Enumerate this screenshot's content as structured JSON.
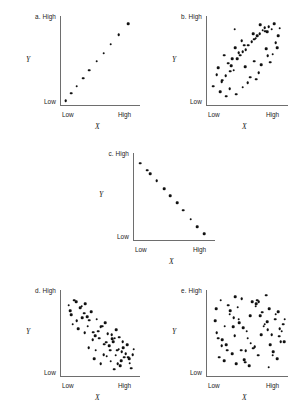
{
  "figure": {
    "background": "#ffffff",
    "dot_color": "#111111",
    "axis_color": "#6e6e6e",
    "axis_labels": {
      "x_var": "X",
      "y_var": "Y",
      "low": "Low",
      "high": "High"
    }
  },
  "chart_data": [
    {
      "type": "scatter",
      "id": "a",
      "panel_label": "a. High",
      "letter": "a",
      "title": "",
      "xlabel": "X",
      "ylabel": "Y",
      "xlim": [
        0,
        100
      ],
      "ylim": [
        0,
        100
      ],
      "xtick_labels": [
        "Low",
        "High"
      ],
      "ytick_labels": [
        "Low",
        "High"
      ],
      "grid": false,
      "relationship": "perfect positive linear correlation",
      "n_points": 10,
      "x": [
        6,
        13,
        20,
        28,
        36,
        45,
        54,
        63,
        73,
        85
      ],
      "y": [
        5,
        13,
        21,
        30,
        39,
        49,
        58,
        68,
        79,
        91
      ]
    },
    {
      "type": "scatter",
      "id": "b",
      "panel_label": "b. High",
      "letter": "b",
      "title": "",
      "xlabel": "X",
      "ylabel": "Y",
      "xlim": [
        0,
        100
      ],
      "ylim": [
        0,
        100
      ],
      "xtick_labels": [
        "Low",
        "High"
      ],
      "ytick_labels": [
        "Low",
        "High"
      ],
      "grid": false,
      "relationship": "moderate positive correlation",
      "n_points": 56,
      "x": [
        12,
        19,
        8,
        26,
        33,
        16,
        41,
        23,
        48,
        30,
        55,
        37,
        62,
        44,
        69,
        51,
        76,
        58,
        83,
        65,
        90,
        72,
        21,
        35,
        28,
        43,
        50,
        57,
        64,
        71,
        78,
        85,
        14,
        31,
        24,
        39,
        46,
        53,
        60,
        67,
        74,
        81,
        88,
        18,
        36,
        29,
        44,
        58,
        66,
        73,
        80,
        87,
        34,
        47,
        61,
        75
      ],
      "y": [
        34,
        28,
        21,
        47,
        39,
        15,
        56,
        33,
        62,
        44,
        71,
        52,
        78,
        60,
        84,
        67,
        88,
        74,
        91,
        80,
        86,
        83,
        56,
        64,
        18,
        72,
        25,
        80,
        36,
        87,
        48,
        70,
        42,
        52,
        10,
        59,
        67,
        31,
        75,
        45,
        82,
        57,
        78,
        26,
        12,
        38,
        20,
        49,
        90,
        63,
        85,
        64,
        85,
        43,
        29,
        55
      ]
    },
    {
      "type": "scatter",
      "id": "c",
      "panel_label": "c. High",
      "letter": "c",
      "title": "",
      "xlabel": "X",
      "ylabel": "Y",
      "xlim": [
        0,
        100
      ],
      "ylim": [
        0,
        100
      ],
      "xtick_labels": [
        "Low",
        "High"
      ],
      "ytick_labels": [
        "Low",
        "High"
      ],
      "grid": false,
      "relationship": "perfect negative linear correlation",
      "n_points": 11,
      "x": [
        8,
        16,
        20,
        28,
        37,
        45,
        53,
        61,
        70,
        78,
        87
      ],
      "y": [
        88,
        80,
        76,
        68,
        59,
        51,
        43,
        34,
        24,
        15,
        7
      ]
    },
    {
      "type": "scatter",
      "id": "d",
      "panel_label": "d. High",
      "letter": "d",
      "title": "",
      "xlabel": "X",
      "ylabel": "Y",
      "xlim": [
        0,
        100
      ],
      "ylim": [
        0,
        100
      ],
      "xtick_labels": [
        "Low",
        "High"
      ],
      "ytick_labels": [
        "Low",
        "High"
      ],
      "grid": false,
      "relationship": "moderate negative correlation",
      "n_points": 64,
      "x": [
        10,
        17,
        24,
        13,
        31,
        20,
        38,
        27,
        45,
        34,
        52,
        41,
        59,
        48,
        66,
        55,
        73,
        62,
        80,
        69,
        87,
        76,
        15,
        29,
        22,
        36,
        43,
        50,
        57,
        64,
        71,
        78,
        85,
        92,
        12,
        26,
        33,
        40,
        47,
        54,
        61,
        68,
        75,
        82,
        89,
        19,
        35,
        42,
        56,
        63,
        70,
        77,
        84,
        91,
        30,
        44,
        58,
        65,
        72,
        79,
        86,
        50,
        67,
        74
      ],
      "y": [
        82,
        88,
        79,
        71,
        84,
        64,
        75,
        68,
        66,
        58,
        58,
        51,
        49,
        44,
        40,
        37,
        31,
        30,
        22,
        24,
        15,
        18,
        60,
        73,
        55,
        65,
        47,
        57,
        39,
        48,
        30,
        40,
        22,
        31,
        76,
        81,
        69,
        42,
        52,
        25,
        35,
        44,
        12,
        26,
        9,
        86,
        33,
        20,
        62,
        17,
        54,
        28,
        36,
        25,
        50,
        30,
        23,
        43,
        14,
        33,
        20,
        14,
        8,
        45
      ]
    },
    {
      "type": "scatter",
      "id": "e",
      "panel_label": "e. High",
      "letter": "e",
      "title": "",
      "xlabel": "X",
      "ylabel": "Y",
      "xlim": [
        0,
        100
      ],
      "ylim": [
        0,
        100
      ],
      "xtick_labels": [
        "Low",
        "High"
      ],
      "ytick_labels": [
        "Low",
        "High"
      ],
      "grid": false,
      "relationship": "no correlation",
      "n_points": 68,
      "x": [
        14,
        28,
        42,
        56,
        70,
        84,
        21,
        35,
        49,
        63,
        77,
        91,
        10,
        24,
        38,
        52,
        66,
        80,
        94,
        17,
        31,
        45,
        59,
        73,
        87,
        12,
        26,
        40,
        54,
        68,
        82,
        96,
        19,
        33,
        47,
        61,
        75,
        89,
        15,
        29,
        43,
        57,
        71,
        85,
        22,
        36,
        50,
        64,
        78,
        92,
        11,
        25,
        39,
        53,
        67,
        81,
        95,
        18,
        32,
        46,
        60,
        74,
        88,
        34,
        62,
        76,
        90,
        48
      ],
      "y": [
        44,
        72,
        30,
        86,
        58,
        66,
        18,
        92,
        52,
        24,
        78,
        40,
        64,
        36,
        80,
        12,
        70,
        48,
        60,
        88,
        26,
        56,
        34,
        94,
        20,
        50,
        82,
        62,
        38,
        74,
        28,
        66,
        42,
        68,
        16,
        84,
        54,
        46,
        22,
        76,
        90,
        32,
        60,
        72,
        58,
        14,
        44,
        86,
        36,
        52,
        78,
        30,
        66,
        70,
        48,
        24,
        40,
        35,
        57,
        19,
        81,
        63,
        75,
        47,
        88,
        10,
        55,
        29
      ]
    }
  ]
}
